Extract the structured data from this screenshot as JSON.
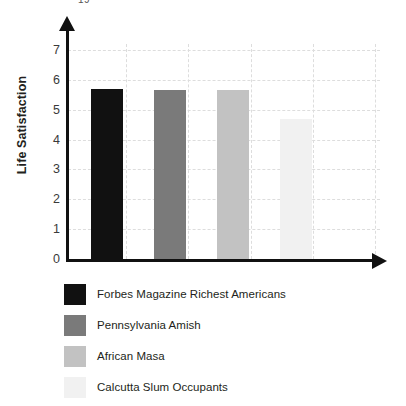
{
  "top_fragment": "19",
  "chart_data": {
    "type": "bar",
    "title": "",
    "xlabel": "",
    "ylabel": "Life Satisfaction",
    "categories": [
      "Forbes Magazine Richest Americans",
      "Pennsylvania Amish",
      "African Masa",
      "Calcutta Slum Occupants"
    ],
    "values": [
      5.7,
      5.65,
      5.65,
      4.7
    ],
    "colors": [
      "#111111",
      "#7a7a7a",
      "#c2c2c2",
      "#f1f1f1"
    ],
    "ylim": [
      0,
      7.2
    ],
    "yticks": [
      0,
      1,
      2,
      3,
      4,
      5,
      6,
      7
    ],
    "ytick_labels": [
      "0",
      "1",
      "2",
      "3",
      "4",
      "5",
      "6",
      "7"
    ],
    "grid": true,
    "grid_style": "dashed",
    "grid_color": "#dddddd",
    "legend_position": "below",
    "axis_color": "#111111",
    "axis_arrows": true,
    "background": "#ffffff"
  },
  "legend": {
    "items": [
      {
        "label": "Forbes Magazine Richest Americans",
        "color": "#111111"
      },
      {
        "label": "Pennsylvania Amish",
        "color": "#7a7a7a"
      },
      {
        "label": "African Masa",
        "color": "#c2c2c2"
      },
      {
        "label": "Calcutta Slum Occupants",
        "color": "#f1f1f1"
      }
    ]
  }
}
